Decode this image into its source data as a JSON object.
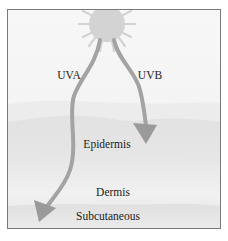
{
  "diagram": {
    "source": {
      "name": "sun-icon"
    },
    "rays": [
      {
        "label": "UVA",
        "reaches": "Subcutaneous"
      },
      {
        "label": "UVB",
        "reaches": "Epidermis"
      }
    ],
    "layers": [
      {
        "label": "Epidermis"
      },
      {
        "label": "Dermis"
      },
      {
        "label": "Subcutaneous"
      }
    ],
    "colors": {
      "background": "#f5f5f5",
      "sun": "#d2d2d2",
      "arrow": "#9a9a9a",
      "layer_light": "#e8e8e8",
      "layer_mid": "#dedede",
      "border": "#7a7a7a"
    }
  }
}
